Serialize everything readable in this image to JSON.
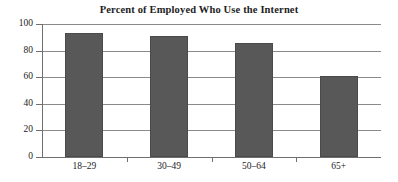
{
  "chart_data": {
    "type": "bar",
    "title": "Percent of Employed Who Use the Internet",
    "xlabel": "",
    "ylabel": "",
    "categories": [
      "18–29",
      "30–49",
      "50–64",
      "65+"
    ],
    "values": [
      93,
      91,
      86,
      61
    ],
    "ylim": [
      0,
      100
    ],
    "yticks": [
      0,
      20,
      40,
      60,
      80,
      100
    ],
    "ytick_labels": [
      "0",
      "20",
      "40",
      "60",
      "80",
      "100"
    ],
    "grid": true,
    "legend": false,
    "bar_color": "#585858",
    "bar_edge_color": "#4a4a4a",
    "grid_color": "#8a8a8a",
    "axis_color": "#6f6f6f",
    "background_color": "#ffffff",
    "text_color": "#1d1d1d"
  }
}
